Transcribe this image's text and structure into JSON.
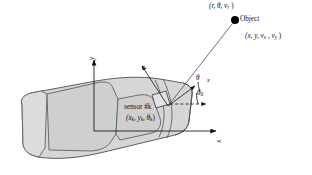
{
  "figure": {
    "type": "technical-diagram",
    "background_color": "#ffffff",
    "ink_color": "#111111",
    "car_fill_color": "#d6d6d6",
    "car_stroke_color": "#5a5a5a"
  },
  "labels": {
    "object_measurement": "(r, θ, v",
    "object_measurement_sub": "r",
    "object_measurement_close": " )",
    "object_name": "Object",
    "object_state_open": "(x, y, v",
    "object_state_sub1": "x",
    "object_state_mid": " , v",
    "object_state_sub2": "y",
    "object_state_close": " )",
    "sensor_name": "sensor #k",
    "sensor_pose_open": "(x",
    "sensor_pose_sub1": "k",
    "sensor_pose_mid1": ", y",
    "sensor_pose_sub2": "k",
    "sensor_pose_mid2": ", θ",
    "sensor_pose_sub3": "k",
    "sensor_pose_close": ")",
    "angle_theta": "θ",
    "angle_theta_zero": "θ",
    "angle_theta_zero_sub": "0",
    "vehicle_axis_x": "x",
    "vehicle_axis_y": "y",
    "sensor_axis_x": "x",
    "sensor_axis_y": "y"
  },
  "geometry": {
    "object_point": {
      "x": 235,
      "y": 20,
      "radius": 4.0
    },
    "sensor_point": {
      "x": 168,
      "y": 106
    },
    "vehicle_origin": {
      "x": 94,
      "y": 131
    },
    "vehicle_axis_x_end": {
      "x": 220,
      "y": 131
    },
    "vehicle_axis_y_end": {
      "x": 94,
      "y": 56
    },
    "range_ray": {
      "from": [
        168,
        106
      ],
      "to": [
        232,
        23
      ]
    },
    "sensor_axis_x_end": {
      "x": 199,
      "y": 84
    },
    "sensor_axis_y_end": {
      "x": 140,
      "y": 64
    },
    "dashed_ref_end": {
      "x": 211,
      "y": 103
    },
    "theta_arc_radius": 38,
    "theta0_arc_radius": 30
  }
}
